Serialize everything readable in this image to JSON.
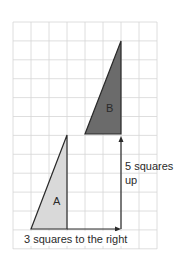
{
  "diagram": {
    "type": "translation-on-grid",
    "grid": {
      "columns": 8,
      "rows": 12,
      "line_color": "#d6d6d6"
    },
    "shapes": [
      {
        "id": "A",
        "label": "A",
        "kind": "right-triangle",
        "fill": "#d9d9d9",
        "stroke": "#2a2a2a",
        "vertices_grid": [
          [
            1,
            11
          ],
          [
            3,
            11
          ],
          [
            3,
            6
          ]
        ]
      },
      {
        "id": "B",
        "label": "B",
        "kind": "right-triangle",
        "fill": "#6b6b6b",
        "stroke": "#2a2a2a",
        "vertices_grid": [
          [
            4,
            6
          ],
          [
            6,
            6
          ],
          [
            6,
            1
          ]
        ]
      }
    ],
    "arrows": [
      {
        "id": "right",
        "from_grid": [
          3,
          11
        ],
        "to_grid": [
          6,
          11
        ]
      },
      {
        "id": "up",
        "from_grid": [
          6,
          11
        ],
        "to_grid": [
          6,
          6
        ]
      }
    ],
    "annotations": {
      "vertical_line1": "5 squares",
      "vertical_line2": "up",
      "horizontal": "3 squares to the right"
    }
  }
}
